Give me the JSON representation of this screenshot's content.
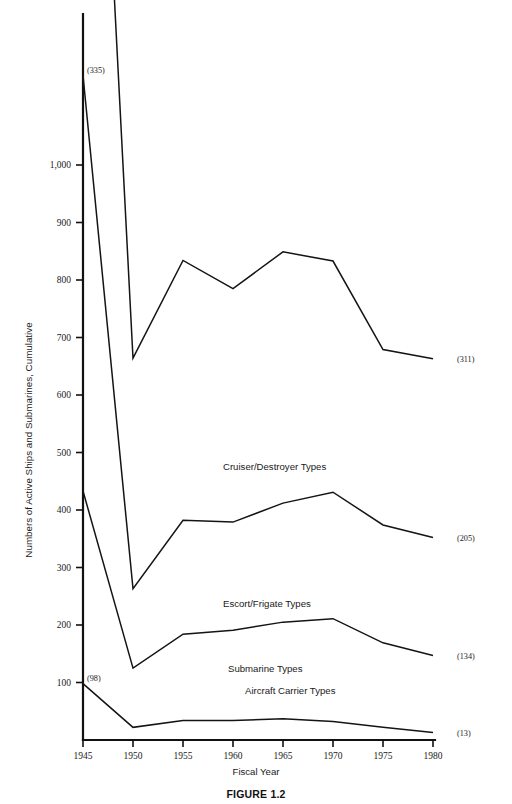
{
  "figure": {
    "caption": "FIGURE 1.2"
  },
  "chart_data": {
    "type": "line",
    "title": "",
    "xlabel": "Fiscal Year",
    "ylabel": "Numbers of Active Ships and Submarines, Cumulative",
    "x": [
      1945,
      1950,
      1955,
      1960,
      1965,
      1970,
      1975,
      1980
    ],
    "xtick_labels": [
      "1945",
      "1950",
      "1955",
      "1960",
      "1965",
      "1970",
      "1975",
      "1980"
    ],
    "xlim": [
      1945,
      1980
    ],
    "ylim": [
      0,
      1260
    ],
    "ytick_values": [
      100,
      200,
      300,
      400,
      500,
      600,
      700,
      800,
      900,
      1000
    ],
    "ytick_labels": [
      "100",
      "200",
      "300",
      "400",
      "500",
      "600",
      "700",
      "800",
      "900",
      "1,000"
    ],
    "grid": false,
    "legend_position": "inline-annotations",
    "cumulative": true,
    "series": [
      {
        "name": "Aircraft Carrier Types",
        "label": "Aircraft Carrier Types",
        "label_x": 1961.2,
        "label_y": 80,
        "start_label": "(98)",
        "end_label": "(13)",
        "values": [
          98,
          22,
          34,
          34,
          37,
          32,
          22,
          13
        ]
      },
      {
        "name": "Submarine Types",
        "label": "Submarine Types",
        "label_x": 1959.5,
        "label_y": 118,
        "start_label": null,
        "end_label": "(134)",
        "values": [
          335,
          103,
          150,
          157,
          168,
          179,
          147,
          134
        ]
      },
      {
        "name": "Escort/Frigate Types",
        "label": "Escort/Frigate Types",
        "label_x": 1959.0,
        "label_y": 232,
        "start_label": "(335)",
        "end_label": "(205)",
        "values": [
          723,
          138,
          198,
          188,
          207,
          220,
          205,
          205
        ]
      },
      {
        "name": "Cruiser/Destroyer Types",
        "label": "Cruiser/Destroyer Types",
        "label_x": 1959.0,
        "label_y": 470,
        "start_label": "(723)",
        "end_label": "(311)",
        "values": [
          1189,
          401,
          452,
          406,
          437,
          402,
          305,
          311
        ]
      }
    ],
    "apex_label": "(1,189",
    "annotations": [
      {
        "text": "(1,189",
        "value": 1189,
        "year": 1945,
        "name": "cruiser-destroyer-apex-label"
      },
      {
        "text": "(723)",
        "value": 723,
        "year": 1945,
        "name": "escort-frigate-start-label"
      },
      {
        "text": "(335)",
        "value": 335,
        "year": 1945,
        "name": "submarine-start-label"
      },
      {
        "text": "(98)",
        "value": 98,
        "year": 1945,
        "name": "aircraft-carrier-start-label"
      },
      {
        "text": "(311)",
        "value": 311,
        "year": 1980,
        "name": "cruiser-destroyer-end-label"
      },
      {
        "text": "(205)",
        "value": 205,
        "year": 1980,
        "name": "escort-frigate-end-label"
      },
      {
        "text": "(134)",
        "value": 134,
        "year": 1980,
        "name": "submarine-end-label"
      },
      {
        "text": "(13)",
        "value": 13,
        "year": 1980,
        "name": "aircraft-carrier-end-label"
      }
    ]
  }
}
